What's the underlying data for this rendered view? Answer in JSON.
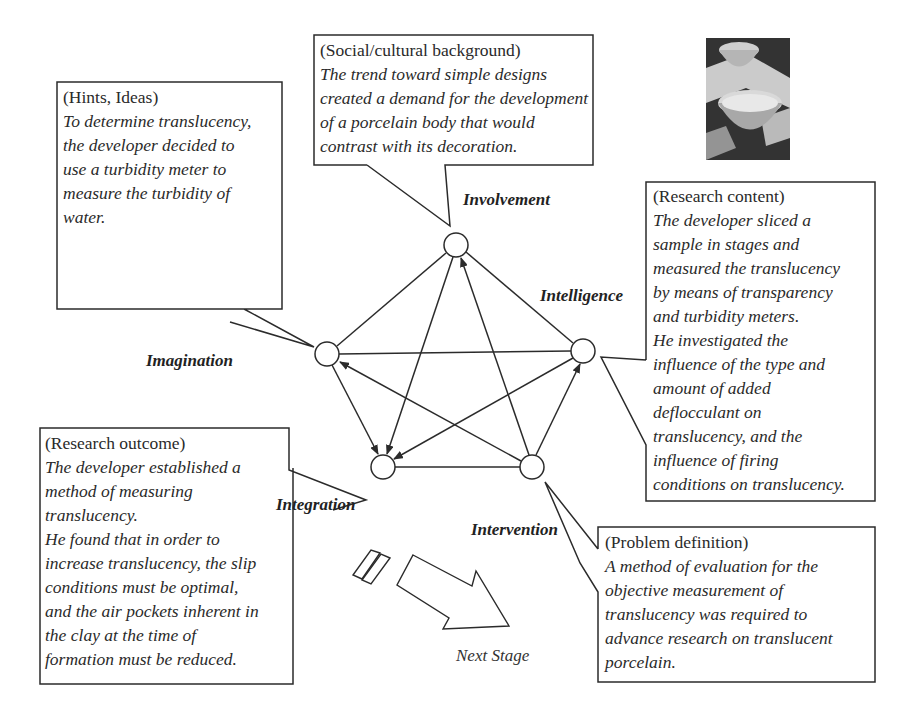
{
  "diagram": {
    "nodes": [
      {
        "id": "involvement",
        "label": "Involvement",
        "x": 456,
        "y": 245
      },
      {
        "id": "intelligence",
        "label": "Intelligence",
        "x": 583,
        "y": 351
      },
      {
        "id": "imagination",
        "label": "Imagination",
        "x": 327,
        "y": 354
      },
      {
        "id": "integration",
        "label": "Integration",
        "x": 383,
        "y": 467
      },
      {
        "id": "intervention",
        "label": "Intervention",
        "x": 532,
        "y": 467
      }
    ],
    "edges_plain": [
      [
        "imagination",
        "involvement"
      ],
      [
        "involvement",
        "intelligence"
      ],
      [
        "imagination",
        "intelligence"
      ],
      [
        "integration",
        "intervention"
      ]
    ],
    "edges_arrow": [
      [
        "involvement",
        "integration"
      ],
      [
        "imagination",
        "integration"
      ],
      [
        "intelligence",
        "integration"
      ],
      [
        "intervention",
        "involvement"
      ],
      [
        "intervention",
        "imagination"
      ],
      [
        "intervention",
        "intelligence"
      ]
    ],
    "next_stage_label": "Next Stage"
  },
  "callouts": {
    "social": {
      "heading": "(Social/cultural background)",
      "body": "The trend toward simple designs\ncreated a demand for the development\nof a porcelain body that would\ncontrast with its decoration."
    },
    "hints": {
      "heading": "(Hints, Ideas)",
      "body": "To determine translucency,\nthe developer decided to\nuse a turbidity meter to\nmeasure the turbidity of\nwater."
    },
    "content": {
      "heading": "(Research content)",
      "body": "The developer sliced a\nsample in stages and\nmeasured the translucency\nby means of transparency\nand turbidity meters.\nHe investigated the\ninfluence of the type and\namount of added\ndeflocculant on\ntranslucency, and the\ninfluence of firing\nconditions on translucency."
    },
    "outcome": {
      "heading": "(Research outcome)",
      "body": "The developer established a\nmethod of measuring\ntranslucency.\nHe found that in order to\nincrease translucency, the slip\nconditions must be optimal,\nand the air pockets inherent in\nthe clay at the time of\nformation must be reduced."
    },
    "problem": {
      "heading": "(Problem definition)",
      "body": "A method of evaluation for the\nobjective measurement of\ntranslucency was required to\nadvance research on translucent\nporcelain."
    }
  },
  "photo": {
    "subject": "porcelain-bowls-photo"
  },
  "colors": {
    "line": "#2b2b2b",
    "text": "#2a2a2a",
    "background": "#ffffff"
  }
}
